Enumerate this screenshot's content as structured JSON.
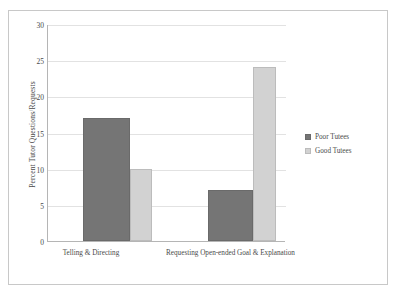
{
  "chart_data": {
    "type": "bar",
    "title": "",
    "xlabel": "",
    "ylabel": "Percent Tutor Questions/Requests",
    "categories": [
      "Telling & Directing",
      "Requesting Open-ended Goal & Explanation"
    ],
    "series": [
      {
        "name": "Poor Tutees",
        "values": [
          17,
          7
        ],
        "color": "#757575"
      },
      {
        "name": "Good Tutees",
        "values": [
          10,
          24
        ],
        "color": "#d2d2d2"
      }
    ],
    "ylim": [
      0,
      30
    ],
    "y_ticks": [
      0,
      5,
      10,
      15,
      20,
      25,
      30
    ],
    "y_tick_labels": [
      "0",
      "5",
      "10",
      "15",
      "20",
      "25",
      "30"
    ],
    "grid": true,
    "legend_position": "right"
  }
}
